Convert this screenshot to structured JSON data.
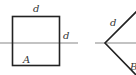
{
  "diagram": {
    "figure_a": {
      "shape": "square",
      "top_label": "d",
      "right_label": "d",
      "area_label": "A"
    },
    "figure_b": {
      "shape": "wedge",
      "upper_label": "d",
      "lower_label": "B"
    },
    "colors": {
      "outline": "#222222",
      "axis_line": "#888888",
      "label": "#333333",
      "background": "#ffffff"
    }
  }
}
